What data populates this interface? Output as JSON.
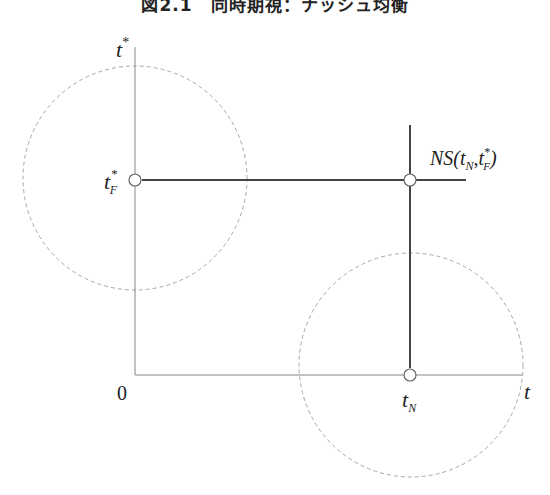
{
  "title": "図2.1　同時期視：ナッシュ均衡",
  "axes": {
    "y_label": "t",
    "y_label_sup": "*",
    "x_label": "t",
    "origin_label": "0"
  },
  "points": {
    "tf": {
      "base": "t",
      "sub": "F",
      "sup": "*"
    },
    "tn": {
      "base": "t",
      "sub": "N"
    }
  },
  "equilibrium": {
    "label_prefix": "NS(",
    "label_t": "t",
    "label_sub_n": "N",
    "label_comma": ",",
    "label_t2": "t",
    "label_sup": "*",
    "label_sub_f": "F",
    "label_suffix": ")"
  },
  "colors": {
    "axis": "#888888",
    "strategy_line": "#444444",
    "dashed_circle": "#aaaaaa"
  }
}
